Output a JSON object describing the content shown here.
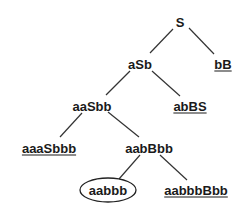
{
  "diagram": {
    "type": "derivation-tree",
    "nodes": [
      {
        "id": "n0",
        "label": "S",
        "x": 180,
        "y": 22,
        "underlined": false,
        "circled": false
      },
      {
        "id": "n1",
        "label": "aSb",
        "x": 140,
        "y": 64,
        "underlined": false,
        "circled": false
      },
      {
        "id": "n2",
        "label": "bB",
        "x": 223,
        "y": 64,
        "underlined": true,
        "circled": false
      },
      {
        "id": "n3",
        "label": "aaSbb",
        "x": 92,
        "y": 106,
        "underlined": false,
        "circled": false
      },
      {
        "id": "n4",
        "label": "abBS",
        "x": 190,
        "y": 106,
        "underlined": true,
        "circled": false
      },
      {
        "id": "n5",
        "label": "aaaSbbb",
        "x": 49,
        "y": 148,
        "underlined": true,
        "circled": false
      },
      {
        "id": "n6",
        "label": "aabBbb",
        "x": 149,
        "y": 148,
        "underlined": false,
        "circled": false
      },
      {
        "id": "n7",
        "label": "aabbb",
        "x": 108,
        "y": 190,
        "underlined": false,
        "circled": true
      },
      {
        "id": "n8",
        "label": "aabbbBbb",
        "x": 196,
        "y": 190,
        "underlined": true,
        "circled": false
      }
    ],
    "edges": [
      {
        "from": "n0",
        "to": "n1",
        "x1": 173,
        "y1": 29,
        "x2": 150,
        "y2": 53
      },
      {
        "from": "n0",
        "to": "n2",
        "x1": 189,
        "y1": 28,
        "x2": 214,
        "y2": 54
      },
      {
        "from": "n1",
        "to": "n3",
        "x1": 130,
        "y1": 71,
        "x2": 106,
        "y2": 95
      },
      {
        "from": "n1",
        "to": "n4",
        "x1": 152,
        "y1": 71,
        "x2": 180,
        "y2": 96
      },
      {
        "from": "n3",
        "to": "n5",
        "x1": 82,
        "y1": 113,
        "x2": 60,
        "y2": 137
      },
      {
        "from": "n3",
        "to": "n6",
        "x1": 108,
        "y1": 112,
        "x2": 139,
        "y2": 137
      },
      {
        "from": "n6",
        "to": "n7",
        "x1": 140,
        "y1": 155,
        "x2": 119,
        "y2": 179
      },
      {
        "from": "n6",
        "to": "n8",
        "x1": 160,
        "y1": 155,
        "x2": 187,
        "y2": 180
      }
    ],
    "colors": {
      "line": "#333333",
      "text": "#1a1a1a",
      "background": "#ffffff"
    }
  }
}
